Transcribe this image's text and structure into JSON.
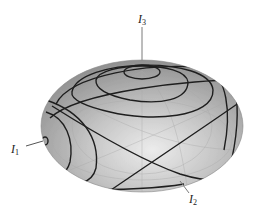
{
  "figure": {
    "labels": {
      "i1": {
        "main": "I",
        "sub": "1"
      },
      "i2": {
        "main": "I",
        "sub": "2"
      },
      "i3": {
        "main": "I",
        "sub": "3"
      }
    },
    "colors": {
      "surface_light": "#e4e4e4",
      "surface_mid": "#bdbdbd",
      "surface_dark": "#8f8f8f",
      "curve": "#1e1e1e",
      "axis_line": "#7a7a7a",
      "grid": "#a9a9a9"
    }
  }
}
